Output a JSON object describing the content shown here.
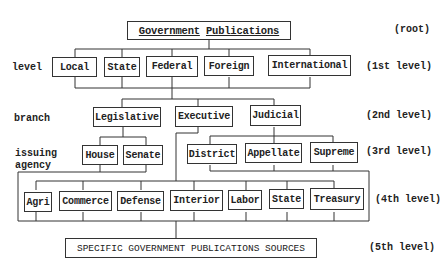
{
  "diagram": {
    "root": "Government Publications",
    "root_words": [
      "Government",
      "Publications"
    ],
    "level_labels": {
      "root": "(root)",
      "first": "(1st level)",
      "second": "(2nd level)",
      "third": "(3rd level)",
      "fourth": "(4th level)",
      "fifth": "(5th level)"
    },
    "side_labels": {
      "level": "level",
      "branch": "branch",
      "issuing_agency_line1": "issuing",
      "issuing_agency_line2": "agency"
    },
    "level1": [
      "Local",
      "State",
      "Federal",
      "Foreign",
      "International"
    ],
    "level2": [
      "Legislative",
      "Executive",
      "Judicial"
    ],
    "level3_legislative": [
      "House",
      "Senate"
    ],
    "level3_judicial": [
      "District",
      "Appellate",
      "Supreme"
    ],
    "level4": [
      "Agri",
      "Commerce",
      "Defense",
      "Interior",
      "Labor",
      "State",
      "Treasury"
    ],
    "level5": "SPECIFIC GOVERNMENT PUBLICATIONS SOURCES"
  }
}
